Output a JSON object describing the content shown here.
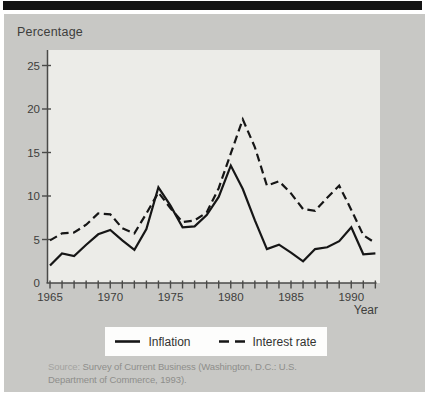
{
  "figure": {
    "axis_unit_label": "Percentage",
    "x_axis_label": "Year"
  },
  "chart_data": {
    "type": "line",
    "title": "",
    "xlabel": "Year",
    "ylabel": "Percentage",
    "x": [
      1965,
      1966,
      1967,
      1968,
      1969,
      1970,
      1971,
      1972,
      1973,
      1974,
      1975,
      1976,
      1977,
      1978,
      1979,
      1980,
      1981,
      1982,
      1983,
      1984,
      1985,
      1986,
      1987,
      1988,
      1989,
      1990,
      1991,
      1992
    ],
    "series": [
      {
        "name": "Inflation",
        "style": "solid",
        "values": [
          2.0,
          3.4,
          3.1,
          4.4,
          5.6,
          6.1,
          4.9,
          3.8,
          6.2,
          11.0,
          8.9,
          6.4,
          6.5,
          7.8,
          9.9,
          13.5,
          10.8,
          7.2,
          3.9,
          4.4,
          3.5,
          2.5,
          3.9,
          4.1,
          4.8,
          6.4,
          3.3,
          3.4
        ]
      },
      {
        "name": "Interest rate",
        "style": "dashed",
        "values": [
          4.9,
          5.7,
          5.8,
          6.7,
          8.0,
          7.9,
          6.3,
          5.7,
          8.0,
          10.4,
          8.6,
          7.0,
          7.2,
          8.1,
          10.9,
          14.9,
          18.8,
          15.6,
          11.2,
          11.7,
          10.3,
          8.5,
          8.3,
          9.8,
          11.2,
          8.4,
          5.5,
          4.6
        ]
      }
    ],
    "ylim": [
      0,
      27
    ],
    "yticks": [
      5,
      10,
      15,
      20,
      25
    ],
    "ytick_labels": [
      "5",
      "10",
      "15",
      "20",
      "25"
    ],
    "y_origin_label": "0",
    "xticks_labeled": [
      1965,
      1970,
      1975,
      1980,
      1985,
      1990
    ],
    "grid": false,
    "legend_position": "bottom",
    "line_color": "#161616",
    "axis_color": "#4a4a48",
    "label_color": "#3e3e3c",
    "plot_background": "#ecece8",
    "panel_background": "#c8c8c5"
  },
  "legend": {
    "items": [
      {
        "label": "Inflation",
        "swatch": "solid-line"
      },
      {
        "label": "Interest rate",
        "swatch": "dashed-line"
      }
    ]
  },
  "source": {
    "label": "Source:",
    "text": "Survey of Current Business (Washington, D.C.: U.S. Department of Commerce, 1993)."
  }
}
